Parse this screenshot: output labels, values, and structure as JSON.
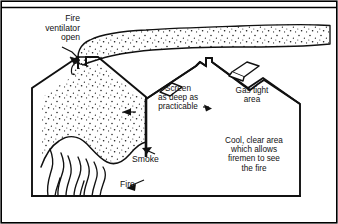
{
  "figure": {
    "type": "technical-cross-section",
    "border_color": "#000000",
    "ink_color": "#111111",
    "smoke_fill": "stipple-dots"
  },
  "labels": {
    "ventilator": "Fire\nventilator\nopen",
    "screen": "Screen\nas deep as\npracticable",
    "gas_tight": "Gas tight\narea",
    "cool_area": "Cool, clear area\nwhich allows\nfiremen to see\nthe fire",
    "smoke": "Smoke",
    "fire": "Fire"
  },
  "elements": {
    "roof_peaks": 3,
    "vent_open_label": "open ventilator at left peak",
    "vent_closed_count": 2,
    "screen_depth_note": "screen hangs from valley between bay 1 and bay 2"
  }
}
